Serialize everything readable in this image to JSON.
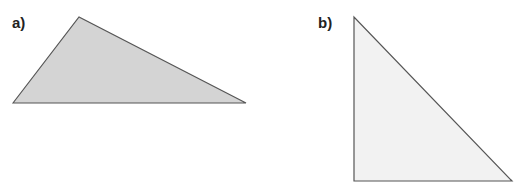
{
  "figures": [
    {
      "label": "a)",
      "fill": "#d4d4d4",
      "stroke": "#555555",
      "points": "13,103 79,17 246,103"
    },
    {
      "label": "b)",
      "fill": "#f2f2f2",
      "stroke": "#555555",
      "points": "354,17 354,181 512,181"
    }
  ]
}
